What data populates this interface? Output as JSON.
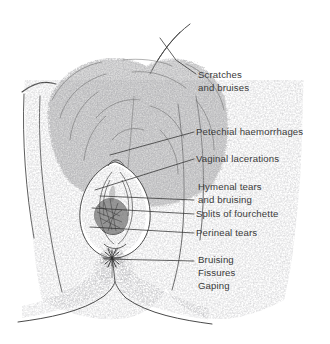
{
  "figure": {
    "background_color": "#ffffff",
    "ink_color": "#4a4a4a",
    "text_color": "#3a3a3a",
    "leader_color": "#2f2f2f"
  },
  "labels": [
    {
      "id": "scratches",
      "name": "scratches-and-bruises",
      "lines": [
        "Scratches",
        "and bruises"
      ],
      "x": 198,
      "y": 78,
      "leader": [
        [
          196,
          74
        ],
        [
          176,
          60
        ],
        [
          160,
          38
        ]
      ]
    },
    {
      "id": "petechial",
      "name": "petechial-haemorrhages",
      "lines": [
        "Petechial haemorrhages"
      ],
      "x": 196,
      "y": 135,
      "leader": [
        [
          194,
          132
        ],
        [
          110,
          155
        ]
      ]
    },
    {
      "id": "vaginal",
      "name": "vaginal-lacerations",
      "lines": [
        "Vaginal lacerations"
      ],
      "x": 196,
      "y": 162,
      "leader": [
        [
          194,
          159
        ],
        [
          95,
          190
        ]
      ]
    },
    {
      "id": "hymenal",
      "name": "hymenal-tears-bruising",
      "lines": [
        "Hymenal tears",
        "and bruising"
      ],
      "x": 198,
      "y": 190,
      "leader": [
        [
          194,
          200
        ],
        [
          100,
          196
        ]
      ]
    },
    {
      "id": "fourchette",
      "name": "splits-of-fourchette",
      "lines": [
        "Splits of fourchette"
      ],
      "x": 196,
      "y": 217,
      "leader": [
        [
          194,
          214
        ],
        [
          92,
          208
        ]
      ]
    },
    {
      "id": "perineal",
      "name": "perineal-tears",
      "lines": [
        "Perineal tears"
      ],
      "x": 196,
      "y": 236,
      "leader": [
        [
          194,
          233
        ],
        [
          90,
          227
        ]
      ]
    },
    {
      "id": "anal",
      "name": "bruising-fissures-gaping",
      "lines": [
        "Bruising",
        "Fissures",
        "Gaping"
      ],
      "x": 198,
      "y": 263,
      "leader": [
        [
          194,
          261
        ],
        [
          104,
          259
        ]
      ]
    }
  ]
}
